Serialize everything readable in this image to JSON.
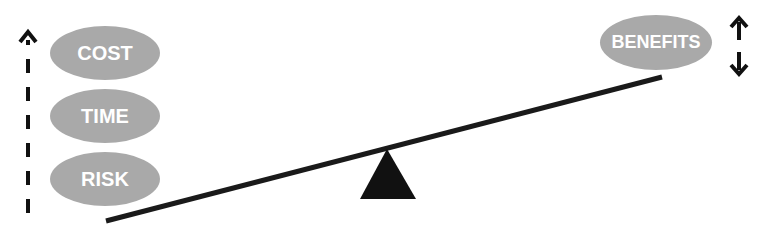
{
  "diagram": {
    "type": "balance-scale",
    "left_items": [
      {
        "label": "COST"
      },
      {
        "label": "TIME"
      },
      {
        "label": "RISK"
      }
    ],
    "right_items": [
      {
        "label": "BENEFITS"
      }
    ],
    "left_indicator": "dashed-up-arrow",
    "right_indicator": "up-down-arrows",
    "colors": {
      "oval_fill": "#a9a9a9",
      "oval_text": "#ffffff",
      "plank": "#1a1a1a",
      "fulcrum": "#111111"
    }
  }
}
